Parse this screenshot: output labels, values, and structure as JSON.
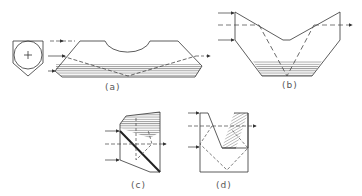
{
  "figure": {
    "panels": [
      {
        "id": "a",
        "label": "(a)"
      },
      {
        "id": "b",
        "label": "(b)"
      },
      {
        "id": "c",
        "label": "(c)"
      },
      {
        "id": "d",
        "label": "(d)"
      }
    ]
  },
  "colors": {
    "line": "#333333",
    "hatch": "#555555",
    "dash": "#444444"
  }
}
